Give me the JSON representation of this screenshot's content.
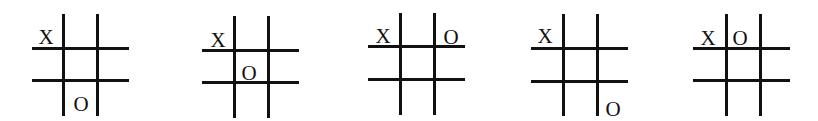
{
  "figure": {
    "line_color": "#111111",
    "background": "#ffffff",
    "boards": [
      {
        "id": 1,
        "cells": [
          [
            "X",
            "",
            ""
          ],
          [
            "",
            "",
            ""
          ],
          [
            "",
            "O",
            ""
          ]
        ],
        "marks": [
          {
            "symbol": "X",
            "row": 0,
            "col": 0
          },
          {
            "symbol": "O",
            "row": 2,
            "col": 1
          }
        ]
      },
      {
        "id": 2,
        "cells": [
          [
            "X",
            "",
            ""
          ],
          [
            "",
            "O",
            ""
          ],
          [
            "",
            "",
            ""
          ]
        ],
        "marks": [
          {
            "symbol": "X",
            "row": 0,
            "col": 0
          },
          {
            "symbol": "O",
            "row": 1,
            "col": 1
          }
        ]
      },
      {
        "id": 3,
        "cells": [
          [
            "X",
            "",
            "O"
          ],
          [
            "",
            "",
            ""
          ],
          [
            "",
            "",
            ""
          ]
        ],
        "marks": [
          {
            "symbol": "X",
            "row": 0,
            "col": 0
          },
          {
            "symbol": "O",
            "row": 0,
            "col": 2
          }
        ]
      },
      {
        "id": 4,
        "cells": [
          [
            "X",
            "",
            ""
          ],
          [
            "",
            "",
            ""
          ],
          [
            "",
            "",
            "O"
          ]
        ],
        "marks": [
          {
            "symbol": "X",
            "row": 0,
            "col": 0
          },
          {
            "symbol": "O",
            "row": 2,
            "col": 2
          }
        ]
      },
      {
        "id": 5,
        "cells": [
          [
            "X",
            "O",
            ""
          ],
          [
            "",
            "",
            ""
          ],
          [
            "",
            "",
            ""
          ]
        ],
        "marks": [
          {
            "symbol": "X",
            "row": 0,
            "col": 0
          },
          {
            "symbol": "O",
            "row": 0,
            "col": 1
          }
        ]
      }
    ]
  },
  "labels": {
    "b1_x": "X",
    "b1_o": "O",
    "b2_x": "X",
    "b2_o": "O",
    "b3_x": "X",
    "b3_o": "O",
    "b4_x": "X",
    "b4_o": "O",
    "b5_x": "X",
    "b5_o": "O"
  }
}
